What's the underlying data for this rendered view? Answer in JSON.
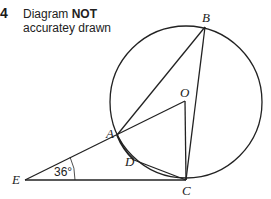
{
  "question": {
    "number": "4",
    "note_part1": "Diagram ",
    "note_bold": "NOT",
    "note_part2": "accuratey drawn"
  },
  "diagram": {
    "circle": {
      "cx": 186,
      "cy": 102,
      "r": 76
    },
    "points": {
      "A": {
        "label": "A",
        "x": 117,
        "y": 135
      },
      "B": {
        "label": "B",
        "x": 205,
        "y": 27
      },
      "C": {
        "label": "C",
        "x": 186,
        "y": 180
      },
      "D": {
        "label": "D",
        "x": 134,
        "y": 160
      },
      "E": {
        "label": "E",
        "x": 25,
        "y": 180
      },
      "O": {
        "label": "O",
        "x": 185,
        "y": 101
      }
    },
    "angle_E": "36°",
    "line_color": "#222222"
  }
}
